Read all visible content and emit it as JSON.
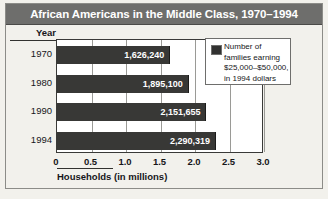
{
  "chart_data": {
    "type": "bar",
    "orientation": "horizontal",
    "title": "African Americans in the Middle Class, 1970–1994",
    "xlabel": "Households (in millions)",
    "ylabel": "Year",
    "categories": [
      "1970",
      "1980",
      "1990",
      "1994"
    ],
    "values": [
      1626240,
      1895100,
      2151655,
      2290319
    ],
    "value_labels": [
      "1,626,240",
      "1,895,100",
      "2,151,655",
      "2,290,319"
    ],
    "xlim": [
      0,
      3.0
    ],
    "xticks": [
      "0",
      "0.5",
      "1.0",
      "1.5",
      "2.0",
      "2.5",
      "3.0"
    ],
    "xtick_values": [
      0,
      0.5,
      1.0,
      1.5,
      2.0,
      2.5,
      3.0
    ],
    "grid": true,
    "legend_position": "inside-top-right",
    "legend": [
      {
        "label_lines": [
          "Number of",
          "families earning",
          "$25,000–$50,000,",
          "in 1994 dollars"
        ],
        "color": "#313130"
      }
    ],
    "colors": {
      "bar": "#383836",
      "title_bar": "#6e6e6c",
      "title_text": "#ffffff",
      "background": "#f2f1ec",
      "plot_background": "#ffffff",
      "gridline": "#9a9a96",
      "axis_text": "#16161a"
    }
  }
}
